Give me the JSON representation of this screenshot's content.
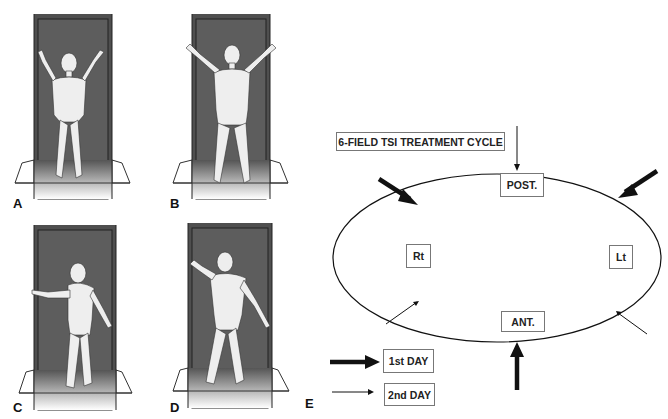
{
  "panels": [
    {
      "id": "A",
      "label": "A",
      "view": "anterior, arms raised"
    },
    {
      "id": "B",
      "label": "B",
      "view": "posterior, arms raised"
    },
    {
      "id": "C",
      "label": "C",
      "view": "right posterior oblique"
    },
    {
      "id": "D",
      "label": "D",
      "view": "left anterior oblique"
    }
  ],
  "diagram": {
    "panel_label": "E",
    "title": "6-FIELD TSI TREATMENT CYCLE",
    "fields": {
      "posterior": "POST.",
      "anterior": "ANT.",
      "right": "Rt",
      "left": "Lt"
    },
    "legend": [
      {
        "label": "1st DAY",
        "arrow": "thick"
      },
      {
        "label": "2nd DAY",
        "arrow": "thin"
      }
    ]
  },
  "colors": {
    "frame": "#4f4f4f",
    "frame_inner": "#5d5d5d",
    "figure": "#eeeeee",
    "line": "#111111"
  }
}
